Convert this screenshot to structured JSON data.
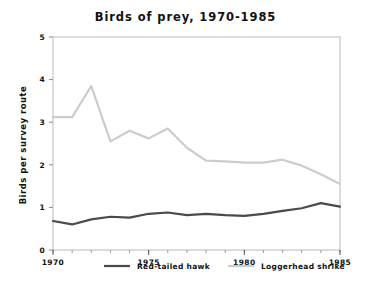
{
  "chart_data": {
    "type": "line",
    "title": "Birds of prey, 1970-1985",
    "xlabel": "",
    "ylabel": "Birds per survey route",
    "xlim": [
      1970,
      1985
    ],
    "ylim": [
      0,
      5
    ],
    "grid": false,
    "legend_position": "bottom",
    "x": [
      1970,
      1971,
      1972,
      1973,
      1974,
      1975,
      1976,
      1977,
      1978,
      1979,
      1980,
      1981,
      1982,
      1983,
      1984,
      1985
    ],
    "xticks": [
      1970,
      1975,
      1980,
      1985
    ],
    "xtick_labels": [
      "1970",
      "1975",
      "1980",
      "1985"
    ],
    "yticks": [
      0,
      1,
      2,
      3,
      4,
      5
    ],
    "ytick_labels": [
      "0",
      "1",
      "2",
      "3",
      "4",
      "5"
    ],
    "series": [
      {
        "name": "Red-tailed hawk",
        "color": "#4a4a4a",
        "values": [
          0.68,
          0.6,
          0.72,
          0.78,
          0.76,
          0.85,
          0.88,
          0.82,
          0.85,
          0.82,
          0.8,
          0.85,
          0.92,
          0.98,
          1.1,
          1.02
        ]
      },
      {
        "name": "Loggerhead shrike",
        "color": "#cccccc",
        "values": [
          3.12,
          3.12,
          3.85,
          2.55,
          2.8,
          2.62,
          2.85,
          2.4,
          2.1,
          2.08,
          2.05,
          2.05,
          2.12,
          1.98,
          1.78,
          1.55
        ]
      }
    ]
  },
  "legend": {
    "items": [
      {
        "label": "Red-tailed hawk",
        "color": "#4a4a4a"
      },
      {
        "label": "Loggerhead shrike",
        "color": "#cccccc"
      }
    ]
  },
  "axis": {
    "y_title": "Birds per survey route"
  }
}
